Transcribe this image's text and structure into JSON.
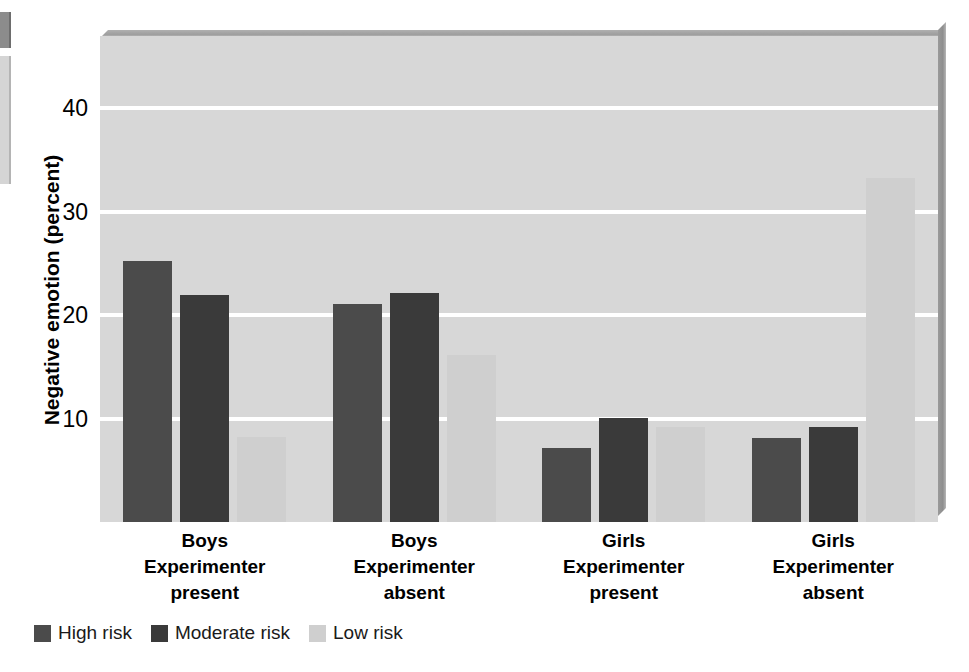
{
  "chart_data": {
    "type": "bar",
    "title": "",
    "xlabel": "",
    "ylabel": "Negative emotion (percent)",
    "ylim": [
      0,
      47
    ],
    "yticks": [
      10,
      20,
      30,
      40
    ],
    "ytick_labels": [
      "10",
      "20",
      "30",
      "40"
    ],
    "grid": true,
    "grid_axis": "y",
    "legend_position": "bottom-left",
    "categories": [
      "Boys Experimenter present",
      "Boys Experimenter absent",
      "Girls Experimenter present",
      "Girls Experimenter absent"
    ],
    "category_lines": [
      [
        "Boys",
        "Experimenter",
        "present"
      ],
      [
        "Boys",
        "Experimenter",
        "absent"
      ],
      [
        "Girls",
        "Experimenter",
        "present"
      ],
      [
        "Girls",
        "Experimenter",
        "absent"
      ]
    ],
    "series": [
      {
        "name": "High risk",
        "color": "#4b4b4b",
        "values": [
          25.2,
          21.1,
          7.2,
          8.1
        ]
      },
      {
        "name": "Moderate risk",
        "color": "#3a3a3a",
        "values": [
          22.0,
          22.1,
          10.1,
          9.2
        ]
      },
      {
        "name": "Low risk",
        "color": "#cfcfcf",
        "values": [
          8.2,
          16.2,
          9.2,
          33.3
        ]
      }
    ]
  },
  "axis": {
    "y_title": "Negative emotion (percent)",
    "y_tick_labels": [
      "40",
      "30",
      "20",
      "10"
    ]
  },
  "legend": {
    "items": [
      {
        "label": "High risk",
        "color": "#4b4b4b"
      },
      {
        "label": "Moderate risk",
        "color": "#3a3a3a"
      },
      {
        "label": "Low risk",
        "color": "#cfcfcf"
      }
    ]
  },
  "colors": {
    "plot_background": "#d7d7d7",
    "gridline": "#ffffff",
    "page_background": "#ffffff",
    "high_risk": "#4b4b4b",
    "moderate_risk": "#3a3a3a",
    "low_risk": "#cfcfcf"
  }
}
